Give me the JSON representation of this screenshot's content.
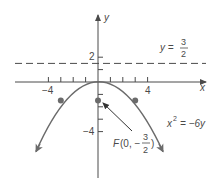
{
  "figure": {
    "type": "parabola-graph",
    "axes": {
      "x_label": "x",
      "y_label": "y",
      "x_tick_labels": [
        {
          "value": -4,
          "text": "−4"
        },
        {
          "value": 4,
          "text": "4"
        }
      ],
      "y_tick_labels": [
        {
          "value": 2,
          "text": "2"
        },
        {
          "value": -4,
          "text": "−4"
        }
      ],
      "x_ticks": [
        -4,
        -3,
        -2,
        -1,
        1,
        2,
        3,
        4
      ],
      "y_ticks": [
        2,
        1,
        -1,
        -2,
        -3,
        -4
      ]
    },
    "directrix": {
      "label_lhs": "y =",
      "label_num": "3",
      "label_den": "2",
      "value": 1.5,
      "style": "dashed"
    },
    "parabola": {
      "equation_lhs": "x",
      "equation_exp": "2",
      "equation_rhs": "= −6y",
      "opens": "down",
      "vertex": [
        0,
        0
      ],
      "marked_points": [
        [
          -3,
          -1.5
        ],
        [
          3,
          -1.5
        ]
      ]
    },
    "focus": {
      "label_prefix": "F(0, −",
      "label_num": "3",
      "label_den": "2",
      "label_suffix": ")",
      "point": [
        0,
        -1.5
      ]
    },
    "colors": {
      "curve": "#6b6b6b",
      "axis": "#4a4a4a",
      "text": "#4a4a4a",
      "point": "#6b6b6b"
    }
  }
}
